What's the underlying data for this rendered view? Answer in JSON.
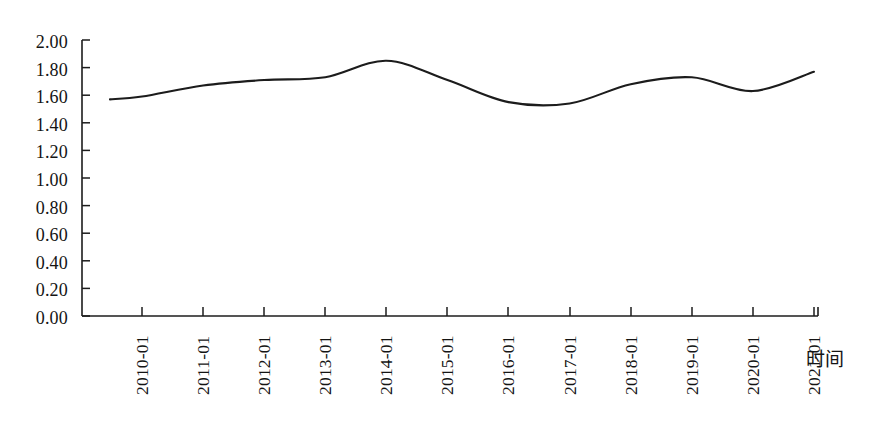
{
  "chart_data": {
    "type": "line",
    "title": "",
    "subtitle": "",
    "xlabel": "时间",
    "ylabel": "",
    "categories": [
      "2010-01",
      "2011-01",
      "2012-01",
      "2013-01",
      "2014-01",
      "2015-01",
      "2016-01",
      "2017-01",
      "2018-01",
      "2019-01",
      "2020-01",
      "2021-01"
    ],
    "series": [
      {
        "name": "",
        "values": [
          1.59,
          1.67,
          1.71,
          1.73,
          1.85,
          1.71,
          1.55,
          1.54,
          1.68,
          1.73,
          1.63,
          1.77
        ]
      }
    ],
    "x": [
      "2010-01",
      "2011-01",
      "2012-01",
      "2013-01",
      "2014-01",
      "2015-01",
      "2016-01",
      "2017-01",
      "2018-01",
      "2019-01",
      "2020-01",
      "2021-01"
    ],
    "values": [
      1.59,
      1.67,
      1.71,
      1.73,
      1.85,
      1.71,
      1.55,
      1.54,
      1.68,
      1.73,
      1.63,
      1.77
    ],
    "ylim": [
      0.0,
      2.0
    ],
    "ytick_labels": [
      "2.00",
      "1.80",
      "1.60",
      "1.40",
      "1.20",
      "1.00",
      "0.80",
      "0.60",
      "0.40",
      "0.20",
      "0.00"
    ],
    "ytick_values": [
      2.0,
      1.8,
      1.6,
      1.4,
      1.2,
      1.0,
      0.8,
      0.6,
      0.4,
      0.2,
      0.0
    ],
    "ytick_step": 0.2,
    "grid": false,
    "legend": "none",
    "line_color": "#1c1c1c",
    "axis_color": "#1c1c1c",
    "background_color": "#ffffff",
    "annotations": [],
    "notes": {
      "start_value": 1.57,
      "peak_label": "2014-01",
      "peak_value": 1.85,
      "trough_value": 1.53,
      "end_value": 1.77
    }
  },
  "axes": {
    "x_title": "时间",
    "y_labels": [
      "2.00",
      "1.80",
      "1.60",
      "1.40",
      "1.20",
      "1.00",
      "0.80",
      "0.60",
      "0.40",
      "0.20",
      "0.00"
    ],
    "x_labels": [
      "2010-01",
      "2011-01",
      "2012-01",
      "2013-01",
      "2014-01",
      "2015-01",
      "2016-01",
      "2017-01",
      "2018-01",
      "2019-01",
      "2020-01",
      "2021-01"
    ]
  }
}
